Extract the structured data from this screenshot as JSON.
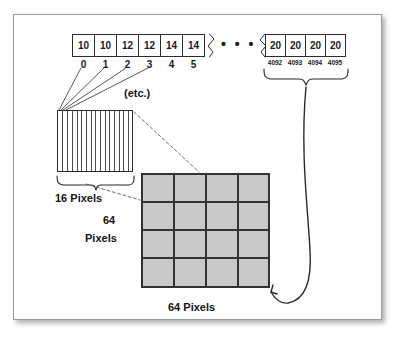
{
  "figure": {
    "title_alt": "Memory array to pixel grid mapping diagram",
    "border_color": "#9a9a9a",
    "grid_fill": "#c9c9c9",
    "grid_line": "#333333",
    "ink": "#1a1a1a"
  },
  "array_left": {
    "values": [
      "10",
      "10",
      "12",
      "12",
      "14",
      "14"
    ],
    "indices": [
      "0",
      "1",
      "2",
      "3",
      "4",
      "5"
    ]
  },
  "ellipsis": "• • •",
  "array_right": {
    "values": [
      "20",
      "20",
      "20",
      "20"
    ],
    "indices": [
      "4092",
      "4093",
      "4094",
      "4095"
    ]
  },
  "labels": {
    "etc": "(etc.)",
    "width_16": "16 Pixels",
    "height_64_line1": "64",
    "height_64_line2": "Pixels",
    "width_64": "64 Pixels"
  },
  "striped_block": {
    "stripe_count": 16
  },
  "pixel_grid": {
    "columns": 4,
    "rows": 4
  },
  "icons": {
    "brace_left": "curly-brace-icon",
    "brace_right": "curly-brace-icon",
    "arrow": "curved-arrow-icon",
    "leader_lines": "leader-line-icon",
    "dashed_connectors": "dashed-connector-icon"
  }
}
